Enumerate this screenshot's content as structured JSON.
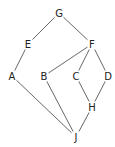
{
  "diagram": {
    "type": "hasse-diagram",
    "nodes": [
      {
        "id": "G",
        "label": "G",
        "x": 59,
        "y": 13
      },
      {
        "id": "E",
        "label": "E",
        "x": 28,
        "y": 44
      },
      {
        "id": "F",
        "label": "F",
        "x": 92,
        "y": 44
      },
      {
        "id": "A",
        "label": "A",
        "x": 12,
        "y": 76
      },
      {
        "id": "B",
        "label": "B",
        "x": 44,
        "y": 76
      },
      {
        "id": "C",
        "label": "C",
        "x": 76,
        "y": 76
      },
      {
        "id": "D",
        "label": "D",
        "x": 108,
        "y": 76
      },
      {
        "id": "H",
        "label": "H",
        "x": 92,
        "y": 107
      },
      {
        "id": "J",
        "label": "J",
        "x": 76,
        "y": 137
      }
    ],
    "edges": [
      [
        "G",
        "E"
      ],
      [
        "G",
        "F"
      ],
      [
        "E",
        "A"
      ],
      [
        "F",
        "B"
      ],
      [
        "F",
        "C"
      ],
      [
        "F",
        "D"
      ],
      [
        "A",
        "J"
      ],
      [
        "B",
        "J"
      ],
      [
        "C",
        "H"
      ],
      [
        "D",
        "H"
      ],
      [
        "H",
        "J"
      ]
    ],
    "colors": {
      "edge": "#555555",
      "label": "#222222",
      "background": "#ffffff"
    }
  }
}
